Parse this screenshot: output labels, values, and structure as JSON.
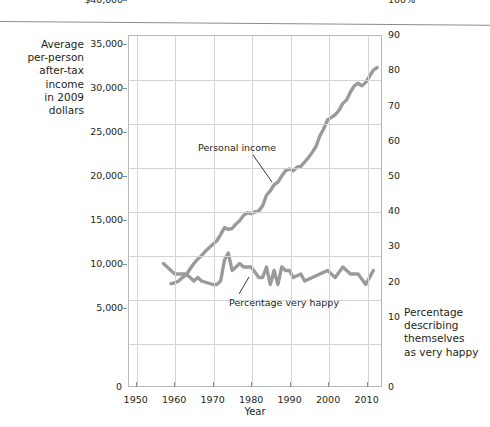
{
  "figure": {
    "axis_label_left": [
      "Average",
      "per-person",
      "after-tax income",
      "in 2009 dollars"
    ],
    "axis_label_right": [
      "Percentage",
      "describing",
      "themselves",
      "as very happy"
    ],
    "xlabel": "Year",
    "zero_left": "0",
    "zero_right": "0"
  },
  "annotations": [
    {
      "name": "personal-income",
      "text": "Personal income"
    },
    {
      "name": "percentage-very-happy",
      "text": "Percentage very happy"
    }
  ],
  "axes": {
    "left_ticks": [
      "$40,000",
      "35,000",
      "30,000",
      "25,000",
      "20,000",
      "15,000",
      "10,000",
      "5,000",
      "0"
    ],
    "left_values": [
      40000,
      35000,
      30000,
      25000,
      20000,
      15000,
      10000,
      5000,
      0
    ],
    "right_ticks": [
      "100%",
      "90",
      "80",
      "70",
      "60",
      "50",
      "40",
      "30",
      "20",
      "10",
      "0"
    ],
    "right_values": [
      100,
      90,
      80,
      70,
      60,
      50,
      40,
      30,
      20,
      10,
      0
    ],
    "x_ticks": [
      "1950",
      "1960",
      "1970",
      "1980",
      "1990",
      "2000",
      "2010"
    ],
    "x_values": [
      1950,
      1960,
      1970,
      1980,
      1990,
      2000,
      2010
    ]
  },
  "colors": {
    "line": "#9a9a9a",
    "grid": "#d3d3d3",
    "frame": "#b9b9b9",
    "text": "#231f20"
  },
  "chart_data": {
    "type": "line",
    "title": "",
    "xlabel": "Year",
    "ylabel": "Average per-person after-tax income in 2009 dollars",
    "ylabel_right": "Percentage describing themselves as very happy",
    "xlim": [
      1948,
      2014
    ],
    "ylim": [
      0,
      40000
    ],
    "ylim_right": [
      0,
      100
    ],
    "grid": true,
    "legend": "annotations-inline",
    "series": [
      {
        "name": "Personal income",
        "axis": "left",
        "units": "2009 dollars",
        "color": "#9a9a9a",
        "x": [
          1959,
          1960,
          1961,
          1962,
          1963,
          1964,
          1965,
          1966,
          1967,
          1968,
          1969,
          1970,
          1971,
          1972,
          1973,
          1974,
          1975,
          1976,
          1977,
          1978,
          1979,
          1980,
          1981,
          1982,
          1983,
          1984,
          1985,
          1986,
          1987,
          1988,
          1989,
          1990,
          1991,
          1992,
          1993,
          1994,
          1995,
          1996,
          1997,
          1998,
          1999,
          2000,
          2001,
          2002,
          2003,
          2004,
          2005,
          2006,
          2007,
          2008,
          2009,
          2010,
          2011,
          2012,
          2013
        ],
        "y": [
          11700,
          11800,
          12000,
          12400,
          12700,
          13400,
          14000,
          14500,
          14900,
          15400,
          15800,
          16200,
          16600,
          17300,
          18100,
          17900,
          18000,
          18500,
          18900,
          19500,
          19800,
          19700,
          19900,
          20000,
          20600,
          21800,
          22300,
          23000,
          23300,
          24000,
          24600,
          24800,
          24600,
          25000,
          25100,
          25600,
          26100,
          26700,
          27400,
          28600,
          29400,
          30400,
          30700,
          31000,
          31500,
          32300,
          32700,
          33600,
          34300,
          34600,
          34300,
          34700,
          35400,
          36100,
          36400
        ]
      },
      {
        "name": "Percentage very happy",
        "axis": "right",
        "units": "percent",
        "color": "#9a9a9a",
        "x": [
          1957,
          1960,
          1963,
          1965,
          1966,
          1967,
          1970,
          1971,
          1972,
          1973,
          1974,
          1975,
          1976,
          1977,
          1978,
          1980,
          1982,
          1983,
          1984,
          1985,
          1986,
          1987,
          1988,
          1989,
          1990,
          1991,
          1993,
          1994,
          1996,
          1998,
          2000,
          2002,
          2004,
          2006,
          2008,
          2010,
          2012
        ],
        "y": [
          35,
          32,
          32,
          30,
          31,
          30,
          29,
          29,
          30,
          36,
          38,
          33,
          34,
          35,
          34,
          34,
          31,
          31,
          34,
          29,
          33,
          29,
          34,
          33,
          33,
          31,
          32,
          30,
          31,
          32,
          33,
          31,
          34,
          32,
          32,
          29,
          33
        ]
      }
    ]
  }
}
